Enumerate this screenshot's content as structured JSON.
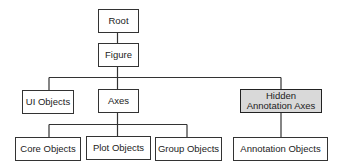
{
  "diagram": {
    "type": "hierarchy-tree",
    "colors": {
      "line": "#333333",
      "box_fill": "#ffffff",
      "hidden_fill": "#d9d9d9"
    },
    "nodes": {
      "root": {
        "label": "Root"
      },
      "figure": {
        "label": "Figure"
      },
      "ui_objects": {
        "label": "UI Objects"
      },
      "axes": {
        "label": "Axes"
      },
      "hidden_annotation_axes": {
        "label_line1": "Hidden",
        "label_line2": "Annotation Axes"
      },
      "core_objects": {
        "label": "Core Objects"
      },
      "plot_objects": {
        "label": "Plot Objects"
      },
      "group_objects": {
        "label": "Group Objects"
      },
      "annotation_objects": {
        "label": "Annotation Objects"
      }
    },
    "edges": [
      [
        "Root",
        "Figure"
      ],
      [
        "Figure",
        "UI Objects"
      ],
      [
        "Figure",
        "Axes"
      ],
      [
        "Figure",
        "Hidden Annotation Axes"
      ],
      [
        "Axes",
        "Core Objects"
      ],
      [
        "Axes",
        "Plot Objects"
      ],
      [
        "Axes",
        "Group Objects"
      ],
      [
        "Hidden Annotation Axes",
        "Annotation Objects"
      ]
    ]
  }
}
